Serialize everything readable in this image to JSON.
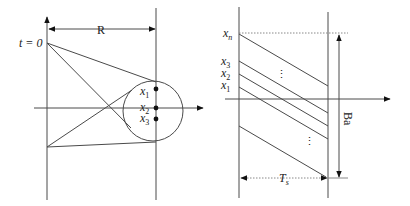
{
  "left_panel": {
    "dimension_label": "R",
    "time_label": "t = 0",
    "points": [
      {
        "label": "x",
        "sub": "1"
      },
      {
        "label": "x",
        "sub": "2"
      },
      {
        "label": "x",
        "sub": "3"
      }
    ]
  },
  "right_panel": {
    "levels": [
      {
        "label": "x",
        "sub": "n"
      },
      {
        "label": "x",
        "sub": "3"
      },
      {
        "label": "x",
        "sub": "2"
      },
      {
        "label": "x",
        "sub": "1"
      }
    ],
    "ellipsis": "⋮",
    "height_label": "Ba",
    "width_label": "T",
    "width_sub": "s"
  },
  "colors": {
    "line": "#4a4a4a",
    "dot": "#111111"
  }
}
